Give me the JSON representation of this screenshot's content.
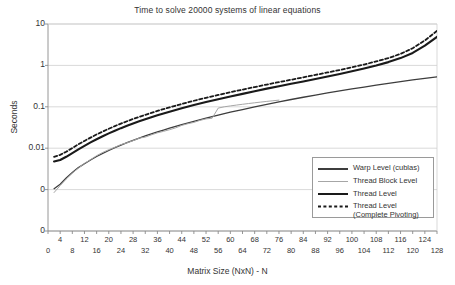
{
  "chart_data": {
    "type": "line",
    "title": "Time to solve 20000 systems of linear equations",
    "xlabel": "Matrix Size (NxN) - N",
    "ylabel": "Seconds",
    "yscale": "log",
    "ylim": [
      0.0001,
      10
    ],
    "xlim": [
      0,
      128
    ],
    "grid": true,
    "legend_position": "bottom-right",
    "ytick_labels": [
      "10",
      "1",
      "0.1",
      "0.01",
      "0",
      "0"
    ],
    "ytick_values": [
      10,
      1,
      0.1,
      0.01,
      0.001,
      0.0001
    ],
    "xtick_labels": [
      "0",
      "4",
      "8",
      "12",
      "16",
      "20",
      "24",
      "28",
      "32",
      "36",
      "40",
      "44",
      "48",
      "52",
      "56",
      "60",
      "64",
      "68",
      "72",
      "76",
      "80",
      "84",
      "88",
      "92",
      "96",
      "100",
      "104",
      "108",
      "112",
      "116",
      "120",
      "124",
      "128"
    ],
    "series": [
      {
        "name": "Warp Level (cublas)",
        "color": "#3d3d3d",
        "style": "solid",
        "width": 1.3,
        "x": [
          2,
          4,
          6,
          8,
          10,
          12,
          14,
          16,
          18,
          20,
          22,
          24,
          26,
          28,
          30,
          32,
          34,
          36,
          38,
          40,
          44,
          48,
          52,
          56,
          60,
          64,
          68,
          72,
          76,
          80,
          84,
          88,
          92,
          96,
          100,
          104,
          108,
          112,
          116,
          120,
          124,
          128
        ],
        "y": [
          0.00105,
          0.00135,
          0.0019,
          0.0026,
          0.0034,
          0.0042,
          0.0052,
          0.0063,
          0.0075,
          0.0088,
          0.0103,
          0.0119,
          0.0136,
          0.0155,
          0.0176,
          0.0198,
          0.0222,
          0.0248,
          0.0275,
          0.0305,
          0.037,
          0.0445,
          0.053,
          0.063,
          0.074,
          0.086,
          0.1,
          0.115,
          0.132,
          0.15,
          0.17,
          0.192,
          0.216,
          0.242,
          0.27,
          0.3,
          0.333,
          0.368,
          0.405,
          0.445,
          0.487,
          0.53
        ]
      },
      {
        "name": "Thread Block Level",
        "color": "#a6a6a6",
        "style": "solid",
        "width": 1.0,
        "x": [
          2,
          4,
          6,
          8,
          10,
          12,
          14,
          16,
          18,
          20,
          22,
          24,
          26,
          28,
          30,
          32,
          34,
          36,
          38,
          40,
          42,
          44,
          46,
          48,
          50,
          52,
          54,
          56,
          58,
          60,
          62,
          64,
          66,
          68,
          70,
          72,
          74,
          76
        ],
        "y": [
          0.00085,
          0.00125,
          0.0018,
          0.0025,
          0.0033,
          0.0043,
          0.0053,
          0.0066,
          0.0079,
          0.0092,
          0.0105,
          0.0122,
          0.0135,
          0.0152,
          0.0175,
          0.0185,
          0.021,
          0.0235,
          0.0255,
          0.028,
          0.031,
          0.0355,
          0.039,
          0.042,
          0.047,
          0.051,
          0.053,
          0.093,
          0.1,
          0.105,
          0.11,
          0.115,
          0.12,
          0.125,
          0.13,
          0.135,
          0.14,
          0.145
        ]
      },
      {
        "name": "Thread Level",
        "color": "#1a1a1a",
        "style": "solid",
        "width": 2.1,
        "x": [
          2,
          4,
          6,
          8,
          10,
          12,
          14,
          16,
          18,
          20,
          22,
          24,
          26,
          28,
          30,
          32,
          34,
          36,
          38,
          40,
          44,
          48,
          52,
          56,
          60,
          64,
          68,
          72,
          76,
          80,
          84,
          88,
          92,
          96,
          100,
          104,
          108,
          112,
          116,
          120,
          124,
          128
        ],
        "y": [
          0.0048,
          0.0052,
          0.0062,
          0.0076,
          0.0094,
          0.0114,
          0.0138,
          0.0165,
          0.0195,
          0.0228,
          0.0265,
          0.0305,
          0.0348,
          0.0395,
          0.0445,
          0.05,
          0.056,
          0.0625,
          0.069,
          0.076,
          0.092,
          0.11,
          0.13,
          0.152,
          0.178,
          0.205,
          0.238,
          0.275,
          0.315,
          0.36,
          0.41,
          0.47,
          0.54,
          0.62,
          0.72,
          0.84,
          0.99,
          1.2,
          1.5,
          2.0,
          3.0,
          4.9
        ]
      },
      {
        "name": "Thread Level (Complete Pivoting)",
        "name_line1": "Thread Level",
        "name_line2": "(Complete Pivoting)",
        "color": "#1a1a1a",
        "style": "dashed",
        "width": 1.8,
        "x": [
          2,
          4,
          6,
          8,
          10,
          12,
          14,
          16,
          18,
          20,
          22,
          24,
          26,
          28,
          30,
          32,
          34,
          36,
          38,
          40,
          44,
          48,
          52,
          56,
          60,
          64,
          68,
          72,
          76,
          80,
          84,
          88,
          92,
          96,
          100,
          104,
          108,
          112,
          116,
          120,
          124,
          128
        ],
        "y": [
          0.0062,
          0.0069,
          0.0082,
          0.0101,
          0.0124,
          0.015,
          0.018,
          0.0215,
          0.0253,
          0.0295,
          0.0342,
          0.0393,
          0.0448,
          0.0508,
          0.0572,
          0.064,
          0.0715,
          0.0795,
          0.088,
          0.097,
          0.117,
          0.14,
          0.165,
          0.193,
          0.225,
          0.26,
          0.3,
          0.345,
          0.395,
          0.45,
          0.515,
          0.59,
          0.675,
          0.775,
          0.9,
          1.05,
          1.25,
          1.5,
          1.9,
          2.6,
          4.0,
          6.8
        ]
      }
    ]
  },
  "legend": {
    "items": [
      {
        "label": "Warp Level (cublas)",
        "label2": ""
      },
      {
        "label": "Thread Block Level",
        "label2": ""
      },
      {
        "label": "Thread Level",
        "label2": ""
      },
      {
        "label": "Thread Level",
        "label2": "(Complete Pivoting)"
      }
    ]
  }
}
